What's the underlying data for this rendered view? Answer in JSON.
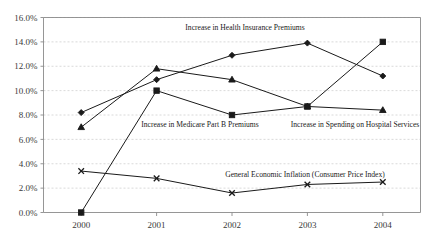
{
  "chart_data": {
    "type": "line",
    "title": "",
    "xlabel": "",
    "ylabel": "",
    "categories": [
      "2000",
      "2001",
      "2002",
      "2003",
      "2004"
    ],
    "x": [
      2000,
      2001,
      2002,
      2003,
      2004
    ],
    "ylim": [
      0.0,
      16.0
    ],
    "yticks": [
      0.0,
      2.0,
      4.0,
      6.0,
      8.0,
      10.0,
      12.0,
      14.0,
      16.0
    ],
    "ytick_labels": [
      "0.0%",
      "2.0%",
      "4.0%",
      "6.0%",
      "8.0%",
      "10.0%",
      "12.0%",
      "14.0%",
      "16.0%"
    ],
    "xtick_labels": [
      "2000",
      "2001",
      "2002",
      "2003",
      "2004"
    ],
    "grid": true,
    "legend_position": "inline-annotations",
    "units": "percent",
    "series": [
      {
        "name": "Increase in Health Insurance Premiums",
        "marker": "diamond",
        "values": [
          8.2,
          10.9,
          12.9,
          13.9,
          11.2
        ]
      },
      {
        "name": "Increase in Medicare Part B Premiums",
        "marker": "square",
        "values": [
          0.0,
          10.0,
          8.0,
          8.7,
          14.0
        ]
      },
      {
        "name": "Increase in Spending on Hospital Services",
        "marker": "triangle",
        "values": [
          7.0,
          11.8,
          10.9,
          8.7,
          8.4
        ]
      },
      {
        "name": "General Economic Inflation (Consumer Price Index)",
        "marker": "x",
        "values": [
          3.4,
          2.8,
          1.6,
          2.3,
          2.5
        ]
      }
    ],
    "annotations": [
      {
        "text": "Increase in Health Insurance Premiums",
        "x": 245,
        "y": 30
      },
      {
        "text": "Increase in Medicare Part B Premiums",
        "x": 200,
        "y": 127
      },
      {
        "text": "Increase in Spending on Hospital Services",
        "x": 355,
        "y": 127
      },
      {
        "text": "General Economic Inflation (Consumer Price Index)",
        "x": 305,
        "y": 177
      }
    ],
    "colors": {
      "line": "#1a1a1a",
      "marker": "#1a1a1a",
      "grid": "#c9c9c9",
      "axis": "#8a8a8a",
      "background": "#ffffff",
      "text": "#1a1a1a"
    }
  }
}
